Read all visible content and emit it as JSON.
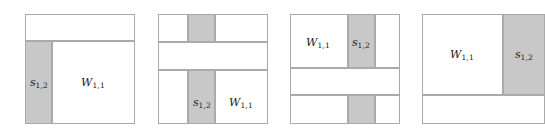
{
  "diagram": {
    "label_s": "s",
    "label_s_sub": "1,2",
    "label_W": "W",
    "label_W_sub": "1,1",
    "colors": {
      "shaded_fill": "#c8c8c8",
      "outline": "#aaaaaa",
      "background": "#ffffff",
      "text": "#1a1a1a"
    },
    "panels": [
      {
        "name": "panel-1",
        "description": "Square split into a top white strip and a lower row containing a shaded left column labelled s and a white region labelled W.",
        "labels": [
          "s",
          "W"
        ]
      },
      {
        "name": "panel-2",
        "description": "Square split into three horizontal strips; a shaded vertical band crosses the top and bottom strips; the bottom strip carries the s and W labels.",
        "labels": [
          "s",
          "W"
        ]
      },
      {
        "name": "panel-3",
        "description": "Square split into three horizontal strips; a shaded vertical band crosses the top and bottom strips; the top strip carries the W and s labels.",
        "labels": [
          "W",
          "s"
        ]
      },
      {
        "name": "panel-4",
        "description": "Square split into a tall upper row with a white region labelled W and a shaded right column labelled s, above a white bottom strip; clipped at the right edge of the image.",
        "labels": [
          "W",
          "s"
        ]
      }
    ]
  }
}
